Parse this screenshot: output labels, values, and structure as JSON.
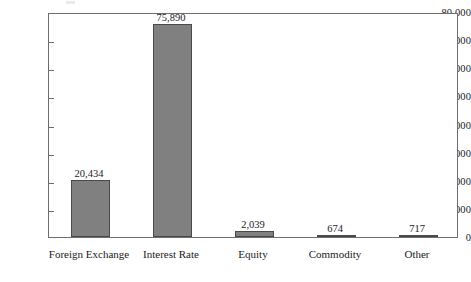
{
  "chart_data": {
    "type": "bar",
    "title": "",
    "subtitle": "",
    "xlabel": "",
    "ylabel": "",
    "categories": [
      "Foreign Exchange",
      "Interest Rate",
      "Equity",
      "Commodity",
      "Other"
    ],
    "values": [
      20434,
      75890,
      2039,
      674,
      717
    ],
    "value_labels": [
      "20,434",
      "75,890",
      "2,039",
      "674",
      "717"
    ],
    "ylim": [
      0,
      80000
    ],
    "ytick_values": [
      0,
      10000,
      20000,
      30000,
      40000,
      50000,
      60000,
      70000,
      80000
    ],
    "ytick_labels": [
      "0",
      "10,000",
      "20,000",
      "30,000",
      "40,000",
      "50,000",
      "60,000",
      "70,000",
      "80,000"
    ],
    "grid": false,
    "legend": null,
    "legend_position": "none",
    "series": [
      {
        "name": "",
        "values": [
          20434,
          75890,
          2039,
          674,
          717
        ]
      }
    ],
    "colors": {
      "bar_fill": "#808080",
      "bar_border": "#4a4a4a",
      "axis": "#6e6e6e",
      "text": "#1a1a1a",
      "background": "#ffffff"
    }
  }
}
